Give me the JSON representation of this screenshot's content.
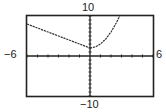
{
  "chart_data": {
    "type": "line",
    "title": "",
    "xlabel": "",
    "ylabel": "",
    "xlim": [
      -6,
      6
    ],
    "ylim": [
      -10,
      10
    ],
    "xscale": 1,
    "yscale": 1,
    "grid": false,
    "window_labels": {
      "xmin": "−6",
      "xmax": "6",
      "ymin": "−10",
      "ymax": "10"
    },
    "series": [
      {
        "name": "f(x), x < 0",
        "description": "line y = 2 - x",
        "x": [
          -6,
          -4,
          -2,
          0
        ],
        "y": [
          8,
          6,
          4,
          2
        ]
      },
      {
        "name": "f(x), x >= 0",
        "description": "parabola y = x^2 + 2",
        "x": [
          0,
          0.5,
          1,
          1.5,
          2,
          2.5,
          2.83
        ],
        "y": [
          2,
          2.25,
          3,
          4.25,
          6,
          8.25,
          10
        ]
      }
    ]
  }
}
